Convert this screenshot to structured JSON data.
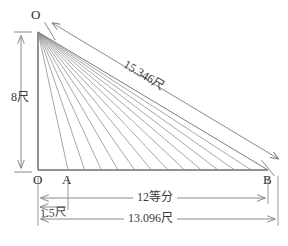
{
  "figure": {
    "type": "geometry-diagram",
    "colors": {
      "line": "#8a8a8a",
      "heavy_line": "#6e6e6e",
      "text": "#333333",
      "background": "#ffffff"
    }
  },
  "vertices": {
    "apex_label": "O",
    "origin_label": "O",
    "first_division_label": "A",
    "end_label": "B"
  },
  "dimensions": {
    "height": "8尺",
    "hypotenuse": "15.346尺",
    "divisions": "12等分",
    "offset": "1.5尺",
    "base": "13.096尺"
  },
  "geometry": {
    "apex": {
      "x": 38,
      "y": 32
    },
    "origin": {
      "x": 38,
      "y": 170
    },
    "point_a": {
      "x": 68,
      "y": 170
    },
    "point_b": {
      "x": 268,
      "y": 170
    },
    "division_count": 12,
    "fan_line_count": 12
  }
}
